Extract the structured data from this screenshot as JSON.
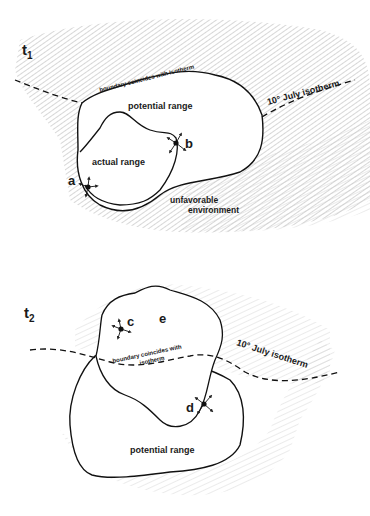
{
  "panels": [
    {
      "time_label": "t",
      "time_sub": "1",
      "labels": {
        "potential_range": "potential range",
        "actual_range": "actual range",
        "unfavorable_1": "unfavorable",
        "unfavorable_2": "environment",
        "boundary": "boundary coincides with isotherm",
        "isotherm": "10° July isotherm"
      },
      "points": {
        "a": "a",
        "b": "b"
      }
    },
    {
      "time_label": "t",
      "time_sub": "2",
      "labels": {
        "potential_range": "potential range",
        "boundary_1": "boundary coincides with",
        "boundary_2": "isotherm",
        "isotherm": "10° July isotherm"
      },
      "points": {
        "c": "c",
        "d": "d",
        "e": "e"
      }
    }
  ]
}
